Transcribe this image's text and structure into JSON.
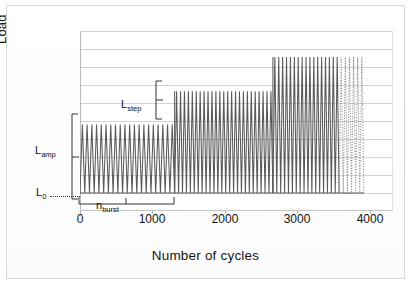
{
  "figure": {
    "background_color": "#ffffff",
    "border_color": "#d8d8d8",
    "line_color": "#555555",
    "grid_color": "#d2d2d2",
    "dotted_color": "#8d8d8d"
  },
  "axes": {
    "ylabel": "Load",
    "xlabel": "Number of cycles"
  },
  "annotations": {
    "l_amp": {
      "letter": "L",
      "sub": "amp"
    },
    "l_zero": {
      "letter": "L",
      "sub": "0"
    },
    "l_step": {
      "letter": "L",
      "sub": "step"
    },
    "n_burst": {
      "letter": "n",
      "sub": "burst"
    }
  },
  "chart_data": {
    "type": "line",
    "title": "",
    "xlabel": "Number of cycles",
    "ylabel": "Load",
    "xlim": [
      0,
      4300
    ],
    "ylim": [
      0,
      10
    ],
    "xticks": [
      0,
      1000,
      2000,
      3000,
      4000
    ],
    "xticklabels": [
      "0",
      "1000",
      "2000",
      "3000",
      "4000"
    ],
    "yticks": [],
    "yticklabels": [],
    "grid": "horizontal",
    "legend": "none",
    "baseline_load": 1.0,
    "amplitude": 3.8,
    "step_increment": 1.85,
    "bursts": [
      {
        "name": "burst-1",
        "x_start": 0,
        "x_end": 1300,
        "peak_load": 4.8,
        "trough_load": 1.0,
        "n_cycles": 20,
        "style": "solid"
      },
      {
        "name": "burst-2",
        "x_start": 1300,
        "x_end": 2650,
        "peak_load": 6.65,
        "trough_load": 1.0,
        "n_cycles": 25,
        "style": "solid"
      },
      {
        "name": "burst-3",
        "x_start": 2650,
        "x_end": 3560,
        "peak_load": 8.55,
        "trough_load": 1.0,
        "n_cycles": 17,
        "style": "solid"
      },
      {
        "name": "burst-3-continued",
        "x_start": 3560,
        "x_end": 3900,
        "peak_load": 8.55,
        "trough_load": 1.0,
        "n_cycles": 6,
        "style": "dotted"
      }
    ],
    "markers": [
      {
        "name": "L_amp",
        "label": "L_amp",
        "type": "bracket",
        "from_load": 1.0,
        "to_load": 4.8,
        "at_x": 0
      },
      {
        "name": "L_0",
        "label": "L_0",
        "type": "leader",
        "at_load": 1.0,
        "at_x": 0
      },
      {
        "name": "L_step",
        "label": "L_step",
        "type": "bracket",
        "from_load": 4.8,
        "to_load": 6.65,
        "at_x": 1300
      },
      {
        "name": "n_burst",
        "label": "n_burst",
        "type": "span-bracket",
        "from_x": 0,
        "to_x": 1300,
        "at_load": 0.45
      }
    ]
  }
}
